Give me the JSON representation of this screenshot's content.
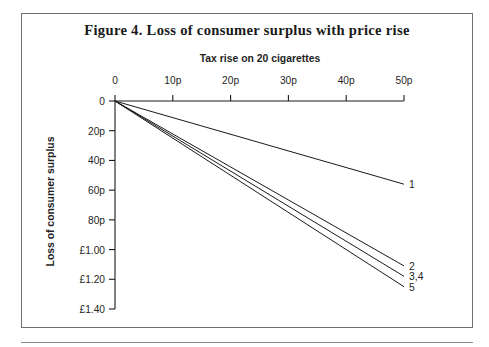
{
  "figure": {
    "title": "Figure 4. Loss of consumer surplus with price rise",
    "frame_color": "#6e6e6e",
    "line_color": "#1a1a1a",
    "background": "#ffffff"
  },
  "chart_data": {
    "type": "line",
    "title": "Figure 4. Loss of consumer surplus with price rise",
    "xlabel": "Tax rise on 20 cigarettes",
    "ylabel": "Loss of consumer surplus",
    "xlabel_position": "top",
    "grid": false,
    "legend": "inline-end-labels",
    "x_axis_position": "top",
    "y_axis_direction": "inverted",
    "xlim": [
      0,
      50
    ],
    "ylim": [
      0,
      140
    ],
    "x_unit": "p",
    "y_unit": "p",
    "xticks": [
      0,
      10,
      20,
      30,
      40,
      50
    ],
    "xticklabels": [
      "0",
      "10p",
      "20p",
      "30p",
      "40p",
      "50p"
    ],
    "yticks": [
      0,
      20,
      40,
      60,
      80,
      100,
      120,
      140
    ],
    "yticklabels": [
      "0",
      "20p",
      "40p",
      "60p",
      "80p",
      "£1.00",
      "£1.20",
      "£1.40"
    ],
    "x": [
      0,
      50
    ],
    "series": [
      {
        "name": "1",
        "label": "1",
        "values": [
          0,
          56
        ]
      },
      {
        "name": "2",
        "label": "2",
        "values": [
          0,
          111
        ]
      },
      {
        "name": "3,4",
        "label": "3,4",
        "values": [
          0,
          118
        ]
      },
      {
        "name": "5",
        "label": "5",
        "values": [
          0,
          125
        ]
      }
    ],
    "series_notes": "Lines 3 and 4 are coincident and share a single label",
    "annotations": [
      {
        "text": "1",
        "x": 50,
        "y": 56
      },
      {
        "text": "2",
        "x": 50,
        "y": 111
      },
      {
        "text": "3,4",
        "x": 50,
        "y": 118
      },
      {
        "text": "5",
        "x": 50,
        "y": 125
      }
    ]
  }
}
